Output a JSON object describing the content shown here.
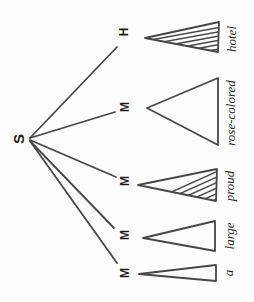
{
  "diagram": {
    "type": "dependency-tree-rotated",
    "root": {
      "label": "S"
    },
    "nodes": [
      {
        "label": "H",
        "word": "hotel",
        "triangle_fill": "hatched"
      },
      {
        "label": "M",
        "word": "rose-colored",
        "triangle_fill": "plain"
      },
      {
        "label": "M",
        "word": "proud",
        "triangle_fill": "hatched"
      },
      {
        "label": "M",
        "word": "large",
        "triangle_fill": "plain"
      },
      {
        "label": "M",
        "word": "a",
        "triangle_fill": "plain"
      }
    ],
    "colors": {
      "stroke": "#474747",
      "text": "#1e1e1e",
      "background": "#fdfdfd"
    }
  }
}
